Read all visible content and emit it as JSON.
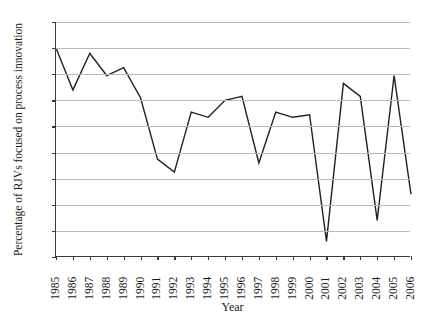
{
  "chart_data": {
    "type": "line",
    "title": "",
    "xlabel": "Year",
    "ylabel": "Percentage of RJVs focused on process innovation",
    "categories": [
      "1985",
      "1986",
      "1987",
      "1988",
      "1989",
      "1990",
      "1991",
      "1992",
      "1993",
      "1994",
      "1995",
      "1996",
      "1997",
      "1998",
      "1999",
      "2000",
      "2001",
      "2002",
      "2003",
      "2004",
      "2005",
      "2006"
    ],
    "values": [
      80,
      64,
      78,
      69.5,
      72.5,
      61,
      37.5,
      32.5,
      55.5,
      53.5,
      60,
      61.5,
      36,
      55.5,
      53.5,
      54.5,
      6,
      66.5,
      61.5,
      14,
      69.5,
      24
    ],
    "series": [
      {
        "name": "Percentage of RJVs focused on process innovation",
        "values": [
          80,
          64,
          78,
          69.5,
          72.5,
          61,
          37.5,
          32.5,
          55.5,
          53.5,
          60,
          61.5,
          36,
          55.5,
          53.5,
          54.5,
          6,
          66.5,
          61.5,
          14,
          69.5,
          24
        ]
      }
    ],
    "y_ticks": [
      0,
      10,
      20,
      30,
      40,
      50,
      60,
      70,
      80,
      90
    ],
    "ylim": [
      0,
      90
    ],
    "xlim": [
      "1985",
      "2006"
    ],
    "grid": true,
    "grid_axis": "y",
    "legend": false,
    "line_color": "#231f20",
    "grid_color": "#b9b9b9",
    "axis_color": "#3a3a3a",
    "background": "#ffffff"
  }
}
